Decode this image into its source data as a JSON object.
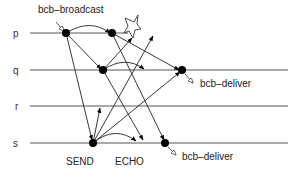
{
  "processes": [
    {
      "id": "p",
      "label": "p"
    },
    {
      "id": "q",
      "label": "q"
    },
    {
      "id": "r",
      "label": "r"
    },
    {
      "id": "s",
      "label": "s"
    }
  ],
  "annotations": {
    "broadcast": "bcb–broadcast",
    "deliver_q": "bcb–deliver",
    "deliver_s": "bcb–deliver",
    "send": "SEND",
    "echo": "ECHO"
  },
  "events": {
    "sender": "s",
    "crashed": "p"
  },
  "colors": {
    "line": "#333333",
    "dot": "#000000"
  }
}
